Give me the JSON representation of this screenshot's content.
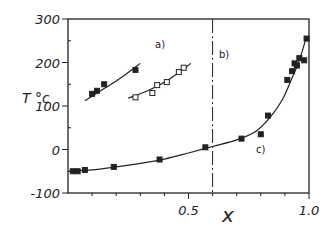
{
  "chart_data": {
    "type": "scatter",
    "title": "",
    "xlabel": "x",
    "ylabel": "T °c",
    "xlim": [
      0,
      1.0
    ],
    "ylim": [
      -100,
      300
    ],
    "x_ticks": [
      "0.5",
      "1.0"
    ],
    "y_ticks": [
      "300",
      "200",
      "100",
      "0",
      "-100"
    ],
    "grid": false,
    "legend": "none",
    "annotations": [
      {
        "text": "a)",
        "x": 0.33,
        "y": 205
      },
      {
        "text": "b)",
        "x": 0.63,
        "y": 220
      },
      {
        "text": "c)",
        "x": 0.81,
        "y": -15
      }
    ],
    "vertical_line": {
      "x": 0.6,
      "style": "dash-dot",
      "label": "b)"
    },
    "series": [
      {
        "name": "a) filled",
        "marker": "filled-square",
        "points": [
          [
            0.1,
            128
          ],
          [
            0.12,
            135
          ],
          [
            0.15,
            150
          ],
          [
            0.28,
            183
          ]
        ],
        "fit": [
          [
            0.07,
            112
          ],
          [
            0.15,
            140
          ],
          [
            0.22,
            165
          ],
          [
            0.3,
            198
          ]
        ]
      },
      {
        "name": "a) open",
        "marker": "open-square",
        "points": [
          [
            0.28,
            120
          ],
          [
            0.35,
            130
          ],
          [
            0.37,
            148
          ],
          [
            0.41,
            155
          ],
          [
            0.46,
            178
          ],
          [
            0.48,
            188
          ]
        ],
        "fit": [
          [
            0.25,
            118
          ],
          [
            0.33,
            135
          ],
          [
            0.41,
            158
          ],
          [
            0.51,
            198
          ]
        ]
      },
      {
        "name": "c)",
        "marker": "filled-square",
        "points": [
          [
            0.02,
            -50
          ],
          [
            0.04,
            -50
          ],
          [
            0.07,
            -47
          ],
          [
            0.19,
            -40
          ],
          [
            0.38,
            -23
          ],
          [
            0.57,
            5
          ],
          [
            0.72,
            25
          ],
          [
            0.8,
            35
          ],
          [
            0.83,
            78
          ],
          [
            0.91,
            160
          ],
          [
            0.93,
            180
          ],
          [
            0.94,
            198
          ],
          [
            0.95,
            193
          ],
          [
            0.96,
            210
          ],
          [
            0.98,
            205
          ],
          [
            0.99,
            255
          ]
        ],
        "fit": [
          [
            0.0,
            -50
          ],
          [
            0.1,
            -47
          ],
          [
            0.2,
            -40
          ],
          [
            0.3,
            -32
          ],
          [
            0.4,
            -22
          ],
          [
            0.5,
            -8
          ],
          [
            0.6,
            7
          ],
          [
            0.7,
            22
          ],
          [
            0.78,
            42
          ],
          [
            0.84,
            75
          ],
          [
            0.89,
            115
          ],
          [
            0.93,
            165
          ],
          [
            0.96,
            205
          ],
          [
            0.99,
            260
          ]
        ]
      }
    ]
  },
  "labels": {
    "ylabel": "T °c",
    "xlabel": "x",
    "annot_a": "a)",
    "annot_b": "b)",
    "annot_c": "c)"
  }
}
